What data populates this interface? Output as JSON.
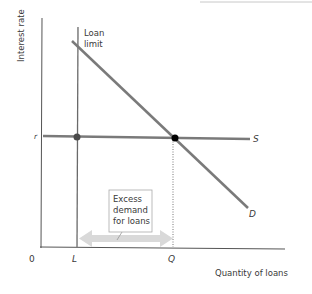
{
  "diagram": {
    "type": "economics-supply-demand-loan-limit",
    "axes": {
      "y_label": "Interest rate",
      "x_label": "Quantity of loans",
      "origin_label": "0"
    },
    "lines": {
      "supply": {
        "label": "S"
      },
      "demand": {
        "label": "D"
      },
      "loan_limit": {
        "label_line1": "Loan",
        "label_line2": "limit"
      }
    },
    "tick_labels": {
      "rate": "r",
      "limit_quantity": "L",
      "equilibrium_quantity": "Q"
    },
    "annotation": {
      "line1": "Excess",
      "line2": "demand",
      "line3": "for loans"
    },
    "colors": {
      "axis": "#555555",
      "curve": "#7a7a7a",
      "arrow": "#d9d9d9",
      "dot": "#000000",
      "dot_limit": "#4a4a4a"
    }
  }
}
